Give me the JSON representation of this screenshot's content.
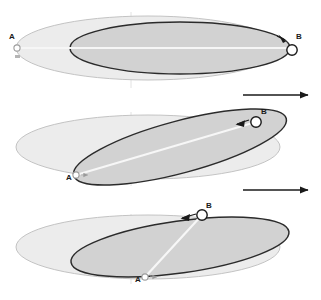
{
  "figure": {
    "title": "",
    "width": 321,
    "height": 300,
    "background": "#ffffff"
  },
  "colors": {
    "outer_ellipse_fill": "#ececec",
    "outer_ellipse_stroke": "#b9b9b9",
    "inner_ellipse_fill": "#d2d2d2",
    "inner_ellipse_stroke": "#2b2b2b",
    "marker_fill": "#ffffff",
    "marker_stroke": "#1a1a1a",
    "label_color": "#1a1a1a",
    "connector_line": "#f2f2f2",
    "axis_line": "#dcdcdc",
    "motion_arrow": "#1a1a1a"
  },
  "labels": {
    "point_a": "A",
    "point_b": "B"
  },
  "panels": [
    {
      "name": "panel-top",
      "index": 1,
      "rotation_deg": 0,
      "point_a": {
        "label": "A",
        "x": 17,
        "y": 48
      },
      "point_b": {
        "label": "B",
        "x": 292,
        "y": 50
      },
      "motion_arrow": {
        "x1": 243,
        "y1": 95,
        "x2": 312,
        "y2": 95,
        "direction": "right"
      },
      "outer_ellipse": {
        "cx": 148,
        "cy": 48,
        "rx": 132,
        "ry": 32
      },
      "inner_ellipse": {
        "cx": 180,
        "cy": 48,
        "rx": 110,
        "ry": 26
      }
    },
    {
      "name": "panel-middle",
      "index": 2,
      "rotation_deg": -15,
      "point_a": {
        "label": "A",
        "x": 76,
        "y": 175
      },
      "point_b": {
        "label": "B",
        "x": 256,
        "y": 122
      },
      "motion_arrow": {
        "x1": 243,
        "y1": 190,
        "x2": 312,
        "y2": 190,
        "direction": "right"
      },
      "outer_ellipse": {
        "cx": 148,
        "cy": 147,
        "rx": 132,
        "ry": 32
      },
      "inner_ellipse": {
        "cx": 180,
        "cy": 147,
        "rx": 110,
        "ry": 26
      }
    },
    {
      "name": "panel-bottom",
      "index": 3,
      "rotation_deg": -8,
      "point_a": {
        "label": "A",
        "x": 145,
        "y": 277
      },
      "point_b": {
        "label": "B",
        "x": 202,
        "y": 215
      },
      "motion_arrow": null,
      "outer_ellipse": {
        "cx": 148,
        "cy": 247,
        "rx": 132,
        "ry": 32
      },
      "inner_ellipse": {
        "cx": 180,
        "cy": 247,
        "rx": 110,
        "ry": 26
      }
    }
  ],
  "annotations": {
    "a_tick_marker": "small-arrow",
    "b_direction_marker": "left-arrowhead"
  }
}
